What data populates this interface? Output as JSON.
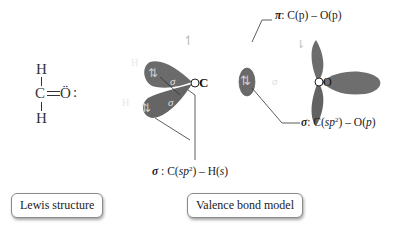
{
  "lewis": {
    "top_h": "H",
    "carbon": "C",
    "double_bond": "═",
    "oxygen": "Ö",
    "lone_pair": ":",
    "bottom_h": "H"
  },
  "model": {
    "h_top": "H",
    "h_bottom": "H",
    "carbon": "C",
    "oxygen": "O",
    "sigma": "σ",
    "spin_pair": "⇅",
    "spin_up": "↿",
    "spin_down": "⇂"
  },
  "labels": {
    "pi": {
      "symbol": "π",
      "text": ": C(p) – O(p)",
      "c": "C(",
      "p": "p",
      "mid": ") – O(",
      "end": ")"
    },
    "sigma_co": {
      "symbol": "σ",
      "pre": ": C(",
      "sp": "sp",
      "sup": "2",
      "mid": ") – O(",
      "p": "p",
      "end": ")"
    },
    "sigma_ch": {
      "symbol": "σ",
      "pre": " : C(",
      "sp": "sp",
      "sup": "2",
      "mid": ") – H(",
      "s": "s",
      "end": ")"
    }
  },
  "captions": {
    "lewis": "Lewis structure",
    "valence": "Valence bond model"
  },
  "colors": {
    "lobe": "#7a7a7a",
    "lobe_dark": "#5e5e5e",
    "h_sphere": "#9a9a9a",
    "line": "#333333"
  }
}
